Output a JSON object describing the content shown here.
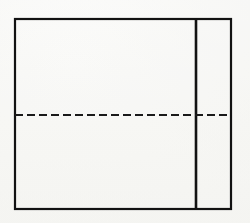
{
  "figure": {
    "kind": "technical-line-drawing",
    "canvas": {
      "width": 250,
      "height": 223
    },
    "background_color": "#fcfcfb",
    "ink_color": "#121212",
    "outer_rectangle": {
      "name": "outer-rectangle",
      "x": 15,
      "y": 19,
      "width": 216,
      "height": 190,
      "right": 231,
      "bottom": 209,
      "stroke_width": 2.2,
      "stroke_color": "#121212",
      "fill": "none"
    },
    "vertical_divider": {
      "name": "vertical-divider-line",
      "x": 196,
      "y_top": 19,
      "y_bottom": 209,
      "stroke_width": 2.6,
      "stroke_color": "#121212"
    },
    "right_panel": {
      "name": "right-panel-region",
      "x": 196,
      "y": 19,
      "width": 35,
      "height": 190
    },
    "left_panel": {
      "name": "left-panel-region",
      "x": 15,
      "y": 19,
      "width": 181,
      "height": 190
    },
    "dashed_centerline": {
      "name": "horizontal-dashed-centerline",
      "x_start": 15,
      "x_end": 231,
      "y": 115,
      "stroke_width": 2.0,
      "stroke_color": "#1a1a1a",
      "dash_length": 8,
      "gap_length": 4,
      "dash_pattern": "8 4",
      "crosses_divider": true
    }
  }
}
